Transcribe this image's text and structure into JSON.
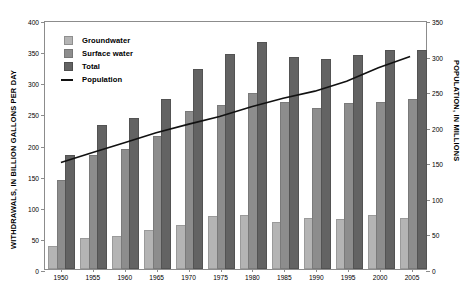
{
  "chart_data": {
    "type": "bar",
    "title": "",
    "xlabel": "",
    "ylabel": "WITHDRAWALS, IN BILLION GALLONS PER DAY",
    "y2label": "POPULATION, IN MILLIONS",
    "grid": false,
    "legend_position": "top-left",
    "categories": [
      "1950",
      "1955",
      "1960",
      "1965",
      "1970",
      "1975",
      "1980",
      "1985",
      "1990",
      "1995",
      "2000",
      "2005"
    ],
    "ylim": [
      0,
      400
    ],
    "yticks": [
      0,
      50,
      100,
      150,
      200,
      250,
      300,
      350,
      400
    ],
    "y2lim": [
      0,
      350
    ],
    "y2ticks": [
      0,
      50,
      100,
      150,
      200,
      250,
      300,
      350
    ],
    "series": [
      {
        "name": "Groundwater",
        "axis": "left",
        "kind": "bar",
        "color": "#b4b4b4",
        "values": [
          34,
          47,
          50,
          60,
          68,
          82,
          83,
          73,
          79,
          77,
          83,
          79
        ]
      },
      {
        "name": "Surface water",
        "axis": "left",
        "kind": "bar",
        "color": "#8d8d8d",
        "values": [
          140,
          180,
          190,
          210,
          250,
          260,
          280,
          265,
          255,
          264,
          265,
          270
        ]
      },
      {
        "name": "Total",
        "axis": "left",
        "kind": "bar",
        "color": "#636363",
        "values": [
          180,
          228,
          240,
          270,
          318,
          342,
          362,
          338,
          334,
          340,
          348,
          349
        ]
      },
      {
        "name": "Population",
        "axis": "right",
        "kind": "line",
        "color": "#111111",
        "values": [
          151,
          165,
          179,
          193,
          205,
          216,
          230,
          242,
          252,
          266,
          285,
          301
        ]
      }
    ],
    "legend": [
      {
        "label": "Groundwater",
        "marker": "swatch",
        "color": "#b4b4b4"
      },
      {
        "label": "Surface water",
        "marker": "swatch",
        "color": "#8d8d8d"
      },
      {
        "label": "Total",
        "marker": "swatch",
        "color": "#636363"
      },
      {
        "label": "Population",
        "marker": "line",
        "color": "#111111"
      }
    ]
  }
}
